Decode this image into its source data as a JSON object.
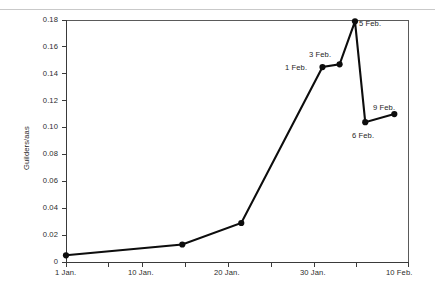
{
  "chart_data": {
    "type": "line",
    "title": "",
    "subtitle": "",
    "xlabel": "",
    "ylabel": "Guilders/aas",
    "grid": false,
    "legend": "none",
    "xlim": [
      0,
      40
    ],
    "ylim": [
      0,
      0.18
    ],
    "x_unit_note": "x in days since 1 Jan. (0 = 1 Jan., 40 = 10 Feb.)",
    "x_tick_values": [
      0,
      5,
      9,
      14,
      19,
      24,
      29,
      34,
      40
    ],
    "x_tick_labels": [
      "1 Jan.",
      "",
      "10 Jan.",
      "",
      "20 Jan.",
      "",
      "30 Jan.",
      "",
      "10 Feb."
    ],
    "x_major_labels": [
      {
        "value": 0,
        "label": "1 Jan."
      },
      {
        "value": 9,
        "label": "10 Jan."
      },
      {
        "value": 19,
        "label": "20 Jan."
      },
      {
        "value": 29,
        "label": "30 Jan."
      },
      {
        "value": 40,
        "label": "10 Feb."
      }
    ],
    "y_tick_values": [
      0,
      0.02,
      0.04,
      0.06,
      0.08,
      0.1,
      0.12,
      0.14,
      0.16,
      0.18
    ],
    "y_tick_labels": [
      "0",
      "0.02",
      "0.04",
      "0.06",
      "0.08",
      "0.10",
      "0.12",
      "0.14",
      "0.16",
      "0.18"
    ],
    "series": [
      {
        "name": "Tulip bulb price",
        "color": "#0d0d0d",
        "marker": "circle",
        "points": [
          {
            "x": 0,
            "y": 0.005,
            "label": ""
          },
          {
            "x": 13.6,
            "y": 0.013,
            "label": ""
          },
          {
            "x": 20.5,
            "y": 0.029,
            "label": ""
          },
          {
            "x": 30.0,
            "y": 0.145,
            "label": "1 Feb."
          },
          {
            "x": 32.0,
            "y": 0.147,
            "label": "3 Feb."
          },
          {
            "x": 33.8,
            "y": 0.179,
            "label": "5 Feb."
          },
          {
            "x": 35.0,
            "y": 0.104,
            "label": "6 Feb."
          },
          {
            "x": 38.4,
            "y": 0.11,
            "label": "9 Feb."
          }
        ]
      }
    ],
    "annotations": [
      {
        "text": "1 Feb.",
        "anchor_x": 30.0,
        "anchor_y": 0.145,
        "placement": "left"
      },
      {
        "text": "3 Feb.",
        "anchor_x": 32.0,
        "anchor_y": 0.147,
        "placement": "above-left"
      },
      {
        "text": "5 Feb.",
        "anchor_x": 33.8,
        "anchor_y": 0.179,
        "placement": "right"
      },
      {
        "text": "6 Feb.",
        "anchor_x": 35.0,
        "anchor_y": 0.104,
        "placement": "below"
      },
      {
        "text": "9 Feb.",
        "anchor_x": 38.4,
        "anchor_y": 0.11,
        "placement": "above-left"
      }
    ]
  },
  "axes": {
    "y_title": "Guilders/aas",
    "y_labels": {
      "t0": "0",
      "t1": "0.02",
      "t2": "0.04",
      "t3": "0.06",
      "t4": "0.08",
      "t5": "0.10",
      "t6": "0.12",
      "t7": "0.14",
      "t8": "0.16",
      "t9": "0.18"
    },
    "x_labels": {
      "t0": "1 Jan.",
      "t1": "10 Jan.",
      "t2": "20 Jan.",
      "t3": "30 Jan.",
      "t4": "10 Feb."
    }
  },
  "annotation_labels": {
    "a0": "1 Feb.",
    "a1": "3 Feb.",
    "a2": "5 Feb.",
    "a3": "6 Feb.",
    "a4": "9 Feb."
  }
}
